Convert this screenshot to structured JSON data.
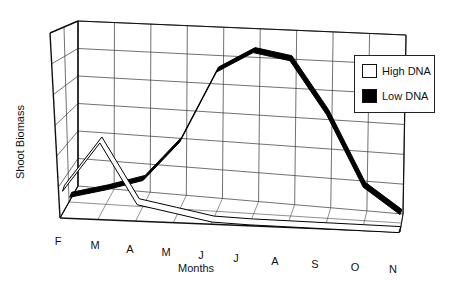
{
  "chart_data": {
    "type": "line",
    "style": "3d-ribbon",
    "title": "",
    "xlabel": "Months",
    "ylabel": "Shoot Biomass",
    "categories": [
      "F",
      "M",
      "A",
      "M",
      "J",
      "J",
      "A",
      "S",
      "O",
      "N"
    ],
    "series": [
      {
        "name": "High DNA",
        "color": "#ffffff",
        "values": [
          1.5,
          4.5,
          0.9,
          0.5,
          0.1,
          0.05,
          0.05,
          0.05,
          0.05,
          0.05
        ]
      },
      {
        "name": "Low DNA",
        "color": "#000000",
        "values": [
          0.3,
          0.9,
          1.6,
          4.0,
          8.2,
          9.4,
          9.0,
          6.0,
          2.0,
          0.6
        ]
      }
    ],
    "ylim": [
      0,
      10
    ],
    "grid": true,
    "legend_position": "upper-right",
    "y_ticks_shown": false
  },
  "labels": {
    "ylabel": "Shoot Biomass",
    "xlabel": "Months",
    "months": [
      "F",
      "M",
      "A",
      "M",
      "J",
      "J",
      "A",
      "S",
      "O",
      "N"
    ]
  },
  "legend": {
    "items": [
      {
        "label": "High DNA",
        "swatch": "#ffffff"
      },
      {
        "label": "Low DNA",
        "swatch": "#000000"
      }
    ]
  }
}
